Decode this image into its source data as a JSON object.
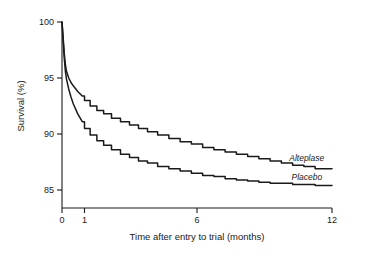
{
  "chart_data": {
    "type": "line",
    "title": "",
    "subtitle": "",
    "xlabel": "Time after entry to trial  (months)",
    "ylabel": "Survival (%)",
    "xlim": [
      0,
      12
    ],
    "ylim": [
      85,
      100
    ],
    "xticks": [
      0,
      1,
      6,
      12
    ],
    "xtick_labels": [
      "0",
      "1",
      "6",
      "12"
    ],
    "yticks": [
      85,
      90,
      95,
      100
    ],
    "ytick_labels": [
      "85",
      "90",
      "95",
      "100"
    ],
    "grid": false,
    "legend_position": "inline-at-curve-end",
    "annotations": [
      {
        "text": "Alteplase",
        "x": 10.1,
        "y": 87.6
      },
      {
        "text": "Placebo",
        "x": 10.2,
        "y": 85.9
      }
    ],
    "series": [
      {
        "name": "Alteplase",
        "label": "Alteplase",
        "color": "#1a1a1a",
        "x": [
          0.0,
          0.05,
          0.1,
          0.15,
          0.2,
          0.3,
          0.4,
          0.5,
          0.7,
          0.9,
          1.1,
          1.4,
          1.7,
          2.0,
          2.4,
          2.8,
          3.2,
          3.6,
          4.0,
          4.5,
          5.0,
          5.5,
          6.0,
          6.5,
          7.0,
          7.5,
          8.0,
          8.5,
          9.0,
          9.5,
          10.0,
          10.5,
          11.0,
          11.5,
          12.0
        ],
        "y": [
          100.0,
          98.6,
          97.2,
          96.2,
          95.6,
          95.0,
          94.6,
          94.3,
          93.8,
          93.4,
          93.0,
          92.5,
          92.1,
          91.8,
          91.4,
          91.1,
          90.8,
          90.5,
          90.2,
          89.9,
          89.6,
          89.3,
          89.1,
          88.8,
          88.6,
          88.4,
          88.2,
          88.0,
          87.8,
          87.6,
          87.4,
          87.2,
          87.1,
          86.9,
          86.9
        ]
      },
      {
        "name": "Placebo",
        "label": "Placebo",
        "color": "#1a1a1a",
        "x": [
          0.0,
          0.05,
          0.1,
          0.15,
          0.2,
          0.3,
          0.4,
          0.5,
          0.7,
          0.9,
          1.1,
          1.4,
          1.7,
          2.0,
          2.4,
          2.8,
          3.2,
          3.6,
          4.0,
          4.5,
          5.0,
          5.5,
          6.0,
          6.5,
          7.0,
          7.5,
          8.0,
          8.5,
          9.0,
          9.5,
          10.0,
          10.5,
          11.0,
          11.5,
          12.0
        ],
        "y": [
          100.0,
          98.4,
          96.8,
          95.6,
          94.9,
          94.0,
          93.3,
          92.7,
          91.8,
          91.1,
          90.5,
          89.9,
          89.4,
          89.0,
          88.6,
          88.2,
          87.9,
          87.6,
          87.4,
          87.1,
          86.9,
          86.7,
          86.5,
          86.3,
          86.2,
          86.0,
          85.9,
          85.8,
          85.7,
          85.6,
          85.6,
          85.5,
          85.5,
          85.4,
          85.4
        ]
      }
    ]
  }
}
